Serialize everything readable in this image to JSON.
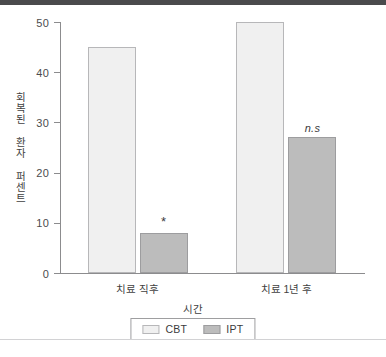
{
  "chart_data": {
    "type": "bar",
    "title": "",
    "subtitle": "",
    "xlabel": "시간",
    "ylabel": "회복된 환자 퍼센트",
    "categories": [
      "치료 직후",
      "치료 1년 후"
    ],
    "series": [
      {
        "name": "CBT",
        "values": [
          45,
          50
        ],
        "color": "#f0f0f0"
      },
      {
        "name": "IPT",
        "values": [
          8,
          27
        ],
        "color": "#bcbcbc"
      }
    ],
    "annotations": [
      {
        "group": "치료 직후",
        "series": "IPT",
        "text": "*"
      },
      {
        "group": "치료 1년 후",
        "series": "IPT",
        "text": "n.s"
      }
    ],
    "ylim": [
      0,
      50
    ],
    "yticks": [
      0,
      10,
      20,
      30,
      40,
      50
    ],
    "ytick_labels": [
      "0",
      "10",
      "20",
      "30",
      "40",
      "50"
    ],
    "grid": false,
    "legend_position": "bottom"
  },
  "legend": {
    "items": [
      {
        "label": "CBT"
      },
      {
        "label": "IPT"
      }
    ]
  }
}
